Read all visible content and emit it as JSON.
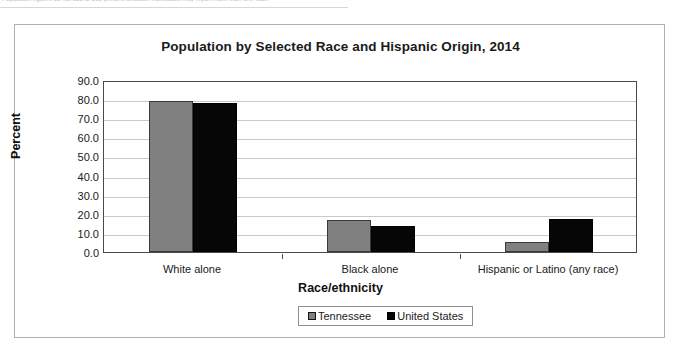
{
  "top_strip": {
    "cut_off_text": "Population figures do not add to 100 percent because individuals may report more than one race."
  },
  "chart_data": {
    "type": "bar",
    "title": "Population by Selected Race and Hispanic Origin, 2014",
    "xlabel": "Race/ethnicity",
    "ylabel": "Percent",
    "categories": [
      "White alone",
      "Black alone",
      "Hispanic or Latino (any race)"
    ],
    "series": [
      {
        "name": "Tennessee",
        "color": "#808080",
        "values": [
          79.0,
          17.0,
          5.0
        ]
      },
      {
        "name": "United States",
        "color": "#060606",
        "values": [
          77.8,
          13.5,
          17.3
        ]
      }
    ],
    "ylim": [
      0.0,
      90.0
    ],
    "ytick_step": 10.0,
    "ytick_labels": [
      "90.0",
      "80.0",
      "70.0",
      "60.0",
      "50.0",
      "40.0",
      "30.0",
      "20.0",
      "10.0",
      "0.0"
    ],
    "grid": true,
    "legend_position": "bottom"
  }
}
